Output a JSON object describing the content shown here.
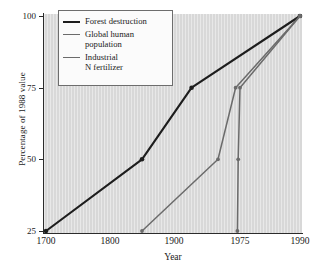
{
  "chart_data": {
    "type": "line",
    "title": "",
    "xlabel": "Year",
    "ylabel": "Percentage of 1988 value",
    "grid": false,
    "legend_position": "upper-left",
    "xticks": [
      1700,
      1800,
      1900,
      1975,
      1990
    ],
    "xtick_labels": [
      "1700",
      "1800",
      "1900",
      "1975",
      "1990"
    ],
    "yticks": [
      25,
      50,
      75,
      100
    ],
    "ytick_labels": [
      "25",
      "50",
      "75",
      "100"
    ],
    "ylim": [
      25,
      100
    ],
    "xlim": [
      1680,
      1995
    ],
    "x_axis_note": "non-linear: compressed after 1900",
    "series": [
      {
        "name": "Forest destruction",
        "color": "#1d1d1d",
        "width": 2.1,
        "marker": "circle",
        "x": [
          1700,
          1850,
          1920,
          1990
        ],
        "y": [
          25,
          50,
          75,
          100
        ]
      },
      {
        "name": "Global human\npopulation",
        "color": "#6b6b6b",
        "width": 1.5,
        "marker": "circle",
        "x": [
          1850,
          1950,
          1970,
          1990
        ],
        "y": [
          25,
          50,
          75,
          100
        ]
      },
      {
        "name": "Industrial\nN fertilizer",
        "color": "#6b6b6b",
        "width": 1.5,
        "marker": "circle",
        "x": [
          1972,
          1973,
          1975,
          1990
        ],
        "y": [
          25,
          50,
          75,
          100
        ]
      }
    ]
  },
  "axes": {
    "x_title": "Year",
    "y_title": "Percentage of 1988 value"
  },
  "legend": {
    "items": [
      {
        "label": "Forest destruction",
        "color": "#1d1d1d"
      },
      {
        "label": "Global human\npopulation",
        "color": "#6b6b6b"
      },
      {
        "label": "Industrial\nN fertilizer",
        "color": "#6b6b6b"
      }
    ]
  },
  "style": {
    "plot_background": "#d8d8d8",
    "page_background": "#ffffff",
    "axis_color": "#2b2b2b",
    "legend_background": "#fbfbfb"
  }
}
